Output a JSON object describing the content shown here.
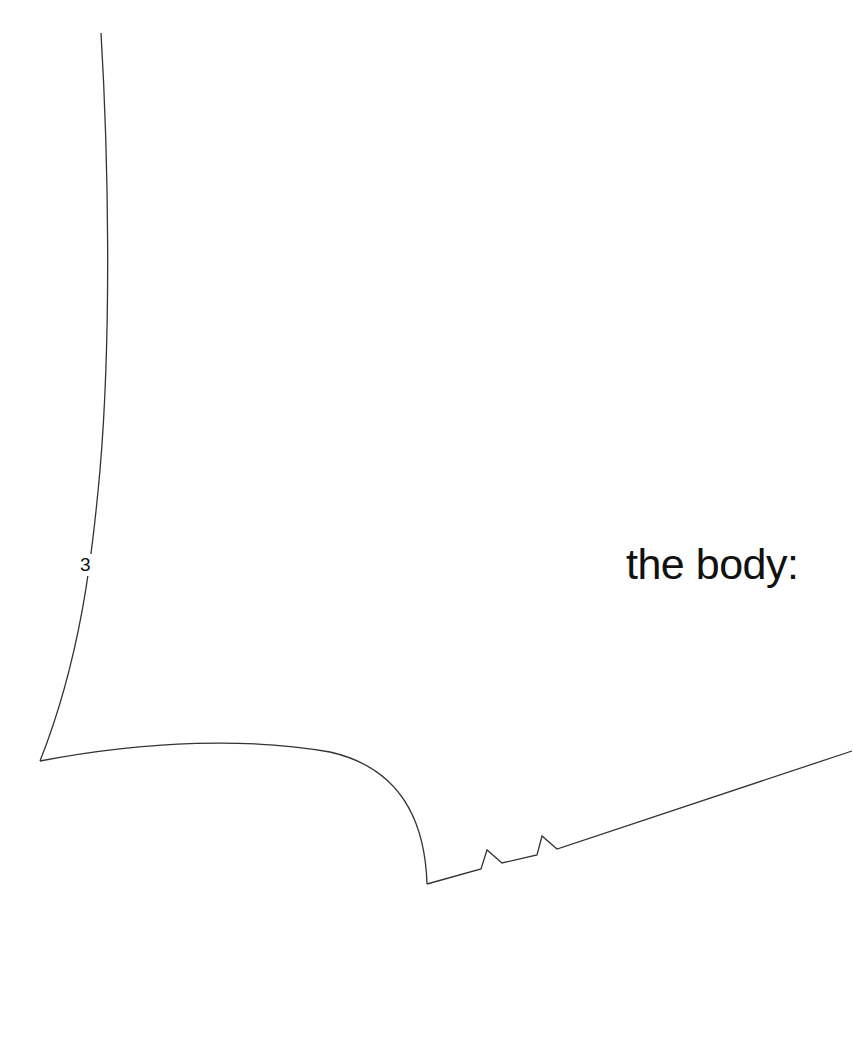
{
  "diagram": {
    "title": "the body:",
    "piece_number": "3",
    "line_color": "#333333",
    "background": "#ffffff"
  }
}
